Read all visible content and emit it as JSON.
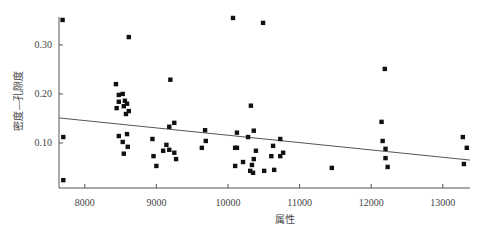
{
  "chart_data": {
    "type": "scatter",
    "title": "",
    "xlabel": "属性",
    "ylabel": "密度—孔隙度",
    "xlim": [
      7640,
      13380
    ],
    "ylim": [
      0.008,
      0.357
    ],
    "xticks": [
      8000,
      9000,
      10000,
      11000,
      12000,
      13000
    ],
    "xtick_labels": [
      "8000",
      "9000",
      "10000",
      "11000",
      "12000",
      "13000"
    ],
    "yticks": [
      0.1,
      0.2,
      0.3
    ],
    "ytick_labels": [
      "0.10",
      "0.20",
      "0.30"
    ],
    "grid": false,
    "legend": null,
    "series": [
      {
        "name": "samples",
        "marker": "square",
        "color": "#111111",
        "points": [
          [
            7690,
            0.351
          ],
          [
            7700,
            0.112
          ],
          [
            7700,
            0.024
          ],
          [
            8615,
            0.316
          ],
          [
            8435,
            0.22
          ],
          [
            8475,
            0.198
          ],
          [
            8530,
            0.2
          ],
          [
            8475,
            0.184
          ],
          [
            8560,
            0.186
          ],
          [
            8590,
            0.18
          ],
          [
            8445,
            0.171
          ],
          [
            8545,
            0.175
          ],
          [
            8615,
            0.165
          ],
          [
            8575,
            0.159
          ],
          [
            8475,
            0.114
          ],
          [
            8590,
            0.118
          ],
          [
            8530,
            0.102
          ],
          [
            8600,
            0.092
          ],
          [
            8545,
            0.078
          ],
          [
            9195,
            0.229
          ],
          [
            9250,
            0.141
          ],
          [
            9180,
            0.133
          ],
          [
            9680,
            0.126
          ],
          [
            8945,
            0.108
          ],
          [
            9690,
            0.104
          ],
          [
            9140,
            0.096
          ],
          [
            9635,
            0.09
          ],
          [
            9095,
            0.084
          ],
          [
            9180,
            0.086
          ],
          [
            9250,
            0.08
          ],
          [
            8960,
            0.073
          ],
          [
            9275,
            0.067
          ],
          [
            9000,
            0.053
          ],
          [
            10070,
            0.355
          ],
          [
            10490,
            0.345
          ],
          [
            10320,
            0.176
          ],
          [
            10360,
            0.125
          ],
          [
            10125,
            0.121
          ],
          [
            10280,
            0.112
          ],
          [
            10730,
            0.108
          ],
          [
            10630,
            0.094
          ],
          [
            10100,
            0.09
          ],
          [
            10125,
            0.09
          ],
          [
            10390,
            0.084
          ],
          [
            10770,
            0.08
          ],
          [
            10605,
            0.073
          ],
          [
            10730,
            0.073
          ],
          [
            10360,
            0.067
          ],
          [
            10210,
            0.061
          ],
          [
            10100,
            0.053
          ],
          [
            10335,
            0.055
          ],
          [
            10645,
            0.045
          ],
          [
            10505,
            0.043
          ],
          [
            10310,
            0.043
          ],
          [
            10350,
            0.039
          ],
          [
            11450,
            0.049
          ],
          [
            12190,
            0.251
          ],
          [
            12145,
            0.143
          ],
          [
            12160,
            0.104
          ],
          [
            12200,
            0.088
          ],
          [
            12200,
            0.069
          ],
          [
            12230,
            0.051
          ],
          [
            13280,
            0.112
          ],
          [
            13335,
            0.09
          ],
          [
            13295,
            0.057
          ]
        ]
      }
    ],
    "trendline": {
      "type": "linear",
      "color": "#555555",
      "x": [
        7640,
        13380
      ],
      "y": [
        0.151,
        0.065
      ]
    },
    "caption": "图 — 密度—孔隙度与属性的交会图"
  }
}
